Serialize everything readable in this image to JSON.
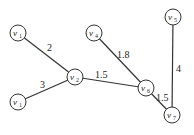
{
  "graph": {
    "nodes": [
      {
        "id": "n_top_left",
        "label": "v",
        "sub": "1",
        "x": 18,
        "y": 33
      },
      {
        "id": "n_center",
        "label": "v",
        "sub": "2",
        "x": 75,
        "y": 77
      },
      {
        "id": "n_bottom_left",
        "label": "v",
        "sub": "1",
        "x": 18,
        "y": 102
      },
      {
        "id": "n_top_mid",
        "label": "v",
        "sub": "4",
        "x": 94,
        "y": 33
      },
      {
        "id": "n_top_right",
        "label": "v",
        "sub": "5",
        "x": 173,
        "y": 17
      },
      {
        "id": "n_mid_right",
        "label": "v",
        "sub": "6",
        "x": 146,
        "y": 88
      },
      {
        "id": "n_bottom_right",
        "label": "v",
        "sub": "7",
        "x": 172,
        "y": 115
      }
    ],
    "edges": [
      {
        "from": "n_top_left",
        "to": "n_center",
        "weight": "2",
        "lx": 50,
        "ly": 50
      },
      {
        "from": "n_bottom_left",
        "to": "n_center",
        "weight": "3",
        "lx": 40,
        "ly": 86
      },
      {
        "from": "n_center",
        "to": "n_mid_right",
        "weight": "1.5",
        "lx": 101,
        "ly": 78
      },
      {
        "from": "n_top_mid",
        "to": "n_mid_right",
        "weight": "1.8",
        "lx": 118,
        "ly": 57
      },
      {
        "from": "n_mid_right",
        "to": "n_bottom_right",
        "weight": "1.5",
        "lx": 155,
        "ly": 100
      },
      {
        "from": "n_top_right",
        "to": "n_bottom_right",
        "weight": "4",
        "lx": 176,
        "ly": 71
      }
    ]
  }
}
